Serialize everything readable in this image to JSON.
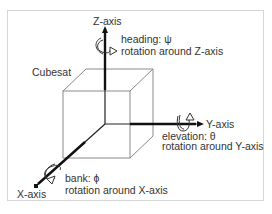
{
  "diagram": {
    "object_label": "Cubesat",
    "axes": {
      "z": {
        "label": "Z-axis",
        "angle_name": "heading",
        "symbol": "ψ",
        "rotation_text": "rotation around Z-axis"
      },
      "y": {
        "label": "Y-axis",
        "angle_name": "elevation",
        "symbol": "θ",
        "rotation_text": "rotation around Y-axis"
      },
      "x": {
        "label": "X-axis",
        "angle_name": "bank",
        "symbol": "ϕ",
        "rotation_text": "rotation around X-axis"
      }
    },
    "texts": {
      "heading_line": "heading: ψ",
      "elevation_line": "elevation: θ",
      "bank_line": "bank: ϕ"
    },
    "colors": {
      "line": "#222222",
      "cube": "#888888",
      "text": "#333333",
      "frame": "#d6d6d6"
    }
  }
}
